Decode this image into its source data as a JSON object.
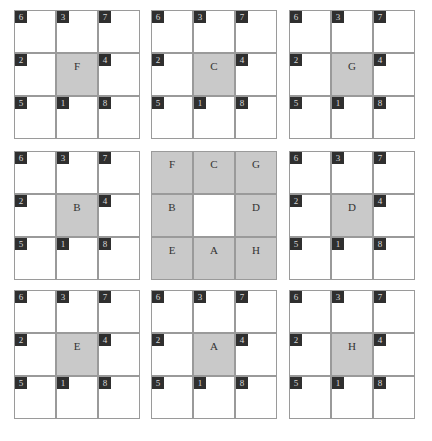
{
  "colors": {
    "grid_line": "#9a9a9a",
    "shaded_cell": "#c9c9c9",
    "badge_bg": "#2f2f2f",
    "badge_text": "#d8d8d8"
  },
  "badge_layout": [
    [
      "6",
      "3",
      "7"
    ],
    [
      "2",
      null,
      "4"
    ],
    [
      "5",
      "1",
      "8"
    ]
  ],
  "panels": [
    {
      "row": 0,
      "col": 0,
      "center_letter": "F"
    },
    {
      "row": 0,
      "col": 1,
      "center_letter": "C"
    },
    {
      "row": 0,
      "col": 2,
      "center_letter": "G"
    },
    {
      "row": 1,
      "col": 0,
      "center_letter": "B"
    },
    {
      "row": 1,
      "col": 1,
      "type": "key",
      "letters": [
        [
          "F",
          "C",
          "G"
        ],
        [
          "B",
          "",
          "D"
        ],
        [
          "E",
          "A",
          "H"
        ]
      ]
    },
    {
      "row": 1,
      "col": 2,
      "center_letter": "D"
    },
    {
      "row": 2,
      "col": 0,
      "center_letter": "E"
    },
    {
      "row": 2,
      "col": 1,
      "center_letter": "A"
    },
    {
      "row": 2,
      "col": 2,
      "center_letter": "H"
    }
  ],
  "caption": ""
}
